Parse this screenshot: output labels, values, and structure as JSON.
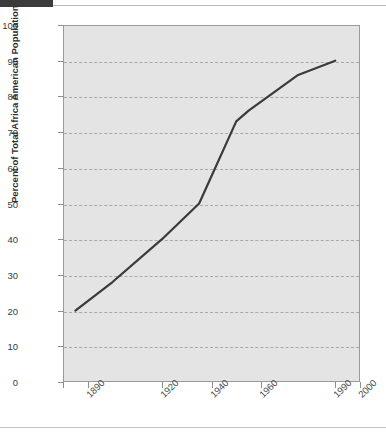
{
  "chart_data": {
    "type": "line",
    "title": "",
    "xlabel": "",
    "ylabel": "Percent of Total Africa American Population",
    "ylim": [
      0,
      100
    ],
    "xlim": [
      1880,
      2000
    ],
    "grid": true,
    "legend": null,
    "y_ticks": [
      0,
      10,
      20,
      30,
      40,
      50,
      60,
      70,
      80,
      90,
      100
    ],
    "x_ticks": [
      "",
      "1890",
      "1920",
      "1940",
      "1960",
      "1990",
      "2000"
    ],
    "x_tick_values": [
      1880,
      1890,
      1920,
      1940,
      1960,
      1990,
      2000
    ],
    "series": [
      {
        "name": "Percent of Total Africa American Population",
        "color": "#3a3a3a",
        "x": [
          1885,
          1900,
          1920,
          1935,
          1950,
          1955,
          1975,
          1990
        ],
        "y": [
          20,
          28,
          40,
          50,
          73,
          76,
          86,
          90
        ]
      }
    ]
  },
  "axes": {
    "y_tick_labels": [
      "100",
      "90",
      "80",
      "70",
      "60",
      "50",
      "40",
      "30",
      "20",
      "10",
      "0"
    ],
    "y_title": "Percent of Total Africa American Population",
    "x_tick_labels": [
      "1890",
      "1920",
      "1940",
      "1960",
      "1990",
      "2000"
    ]
  },
  "colors": {
    "plot_background": "#e4e4e4",
    "gridline": "#a9a9a9",
    "axis": "#9a9a9a",
    "line": "#3a3a3a",
    "header_bar": "#3b3b3b",
    "rule": "#c3c3c3"
  }
}
